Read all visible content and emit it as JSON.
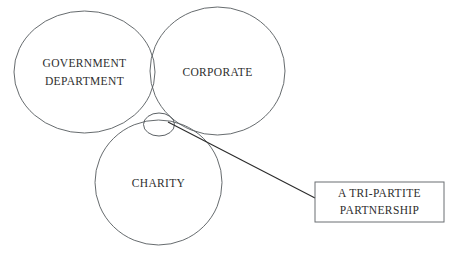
{
  "diagram": {
    "background_color": "#ffffff",
    "stroke_color": "#555a5e",
    "text_color": "#2e2e2e",
    "circles": [
      {
        "id": "government-department",
        "label_lines": [
          "GOVERNMENT",
          "DEPARTMENT"
        ],
        "line1": "GOVERNMENT",
        "line2": "DEPARTMENT",
        "cx": 84.5,
        "cy": 72,
        "rx": 70.5,
        "ry": 61
      },
      {
        "id": "corporate",
        "label_lines": [
          "CORPORATE"
        ],
        "line1": "CORPORATE",
        "line2": "",
        "cx": 217.5,
        "cy": 71,
        "rx": 67.5,
        "ry": 64
      },
      {
        "id": "charity",
        "label_lines": [
          "CHARITY"
        ],
        "line1": "CHARITY",
        "line2": "",
        "cx": 158.5,
        "cy": 182.5,
        "rx": 63.5,
        "ry": 62.5
      }
    ],
    "hub": {
      "id": "intersection-hub",
      "cx": 159,
      "cy": 124.5,
      "rx": 15.5,
      "ry": 11.5
    },
    "leader_line": {
      "id": "hub-to-callout",
      "x1": 168,
      "y1": 122,
      "x2": 315,
      "y2": 198
    },
    "callout": {
      "id": "tri-partite-callout",
      "line1": "A TRI-PARTITE",
      "line2": "PARTNERSHIP",
      "x": 315,
      "y": 182,
      "width": 129,
      "height": 40
    }
  }
}
